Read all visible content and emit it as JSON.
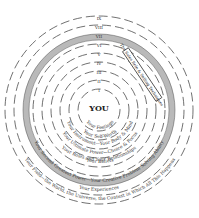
{
  "center_label": "YOU",
  "rings": [
    {
      "numeral": "I",
      "label": "Your Feelings"
    },
    {
      "numeral": "II",
      "label": "Your Self-Worth"
    },
    {
      "numeral": "III",
      "label": "Your Instrument—Your Body & Mind"
    },
    {
      "numeral": "IV",
      "label": "Your Ultimate Power—Choice & Focus"
    },
    {
      "numeral": "V",
      "label": "Your Beliefs"
    },
    {
      "numeral": "VI",
      "label": "Your Roles and Your Relationships"
    },
    {
      "numeral": "VII",
      "label": "Your Second Greatest Power—Your Creative Problem Solving Ability"
    },
    {
      "numeral": "VIII",
      "label": "Your Experiences"
    },
    {
      "numeral": "IX",
      "label": "Your Field—the World, the Universe, the Context in Which All This Happens"
    }
  ],
  "callout_box": "The Sales Role & Selling Techniques",
  "colors": {
    "band": "#b9b9b9",
    "line": "#333333"
  }
}
